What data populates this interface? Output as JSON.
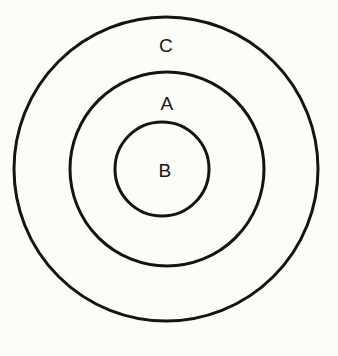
{
  "diagram": {
    "type": "euler-diagram",
    "canvas": {
      "width": 338,
      "height": 356,
      "background": "#fdfdf8"
    },
    "stroke_color": "#141412",
    "text_color": "#161613",
    "circles": [
      {
        "id": "outer",
        "label": "C",
        "cx": 166,
        "cy": 169,
        "r": 152,
        "stroke_width": 3,
        "fill": "none",
        "label_x": 166,
        "label_y": 45
      },
      {
        "id": "middle",
        "label": "A",
        "cx": 167,
        "cy": 169,
        "r": 97,
        "stroke_width": 3,
        "fill": "none",
        "label_x": 167,
        "label_y": 103
      },
      {
        "id": "inner",
        "label": "B",
        "cx": 162,
        "cy": 169,
        "r": 47,
        "stroke_width": 3,
        "fill": "none",
        "label_x": 165,
        "label_y": 170
      }
    ],
    "labels": {
      "outer": "C",
      "middle": "A",
      "inner": "B"
    }
  }
}
